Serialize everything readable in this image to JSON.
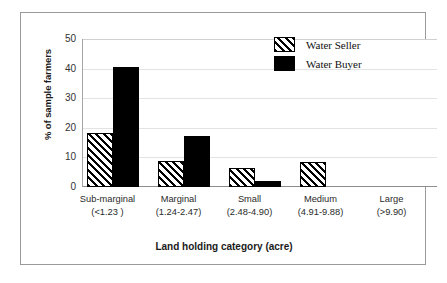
{
  "chart_data": {
    "type": "bar",
    "title": "",
    "xlabel": "Land holding category (acre)",
    "ylabel": "% of sample farmers",
    "categories": [
      {
        "line1": "Sub-marginal",
        "line2": "(<1.23 )"
      },
      {
        "line1": "Marginal",
        "line2": "(1.24-2.47)"
      },
      {
        "line1": "Small",
        "line2": "(2.48-4.90)"
      },
      {
        "line1": "Medium",
        "line2": "(4.91-9.88)"
      },
      {
        "line1": "Large",
        "line2": "(>9.90)"
      }
    ],
    "series": [
      {
        "name": "Water Seller",
        "pattern": "diagonal-hatch",
        "color": "#000000",
        "fill": "#ffffff",
        "values": [
          18.2,
          8.7,
          6.4,
          8.5,
          0
        ]
      },
      {
        "name": "Water Buyer",
        "pattern": "solid",
        "color": "#000000",
        "fill": "#000000",
        "values": [
          40.5,
          17.1,
          2.2,
          0,
          0
        ]
      }
    ],
    "ylim": [
      0,
      50
    ],
    "yticks": [
      0,
      10,
      20,
      30,
      40,
      50
    ],
    "ytick_labels": [
      "0",
      "10",
      "20",
      "30",
      "40",
      "50"
    ],
    "grid": "horizontal",
    "legend_position": "top-right",
    "frame_color": "#9a9a9a",
    "gridline_color": "#e3e3e3",
    "axis_color": "#8d8d8d"
  }
}
